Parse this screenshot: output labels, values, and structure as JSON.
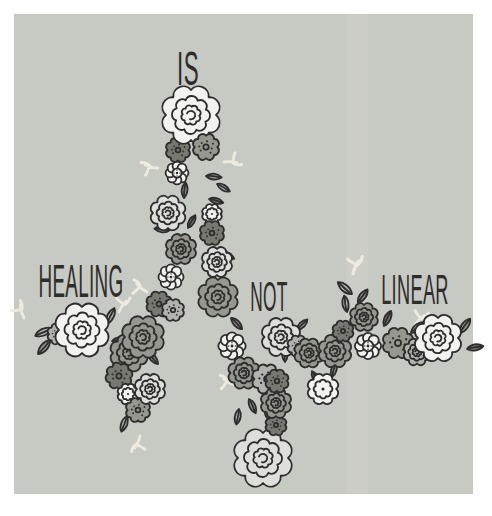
{
  "poster": {
    "phrase": "HEALING IS NOT LINEAR",
    "words": {
      "healing": "HEALING",
      "is": "IS",
      "not": "NOT",
      "linear": "LINEAR"
    },
    "palette": {
      "page_bg": "#ffffff",
      "canvas_bg": "#c7c9c3",
      "canvas_band": "#cdcfc9",
      "ink": "#2d2d2b",
      "flower_white": "#f2f2ef",
      "flower_light": "#dedfdb",
      "gray_light": "#b2b3af",
      "gray_mid": "#96978f",
      "gray_dark": "#77786f",
      "sprig": "#edebdf"
    }
  }
}
